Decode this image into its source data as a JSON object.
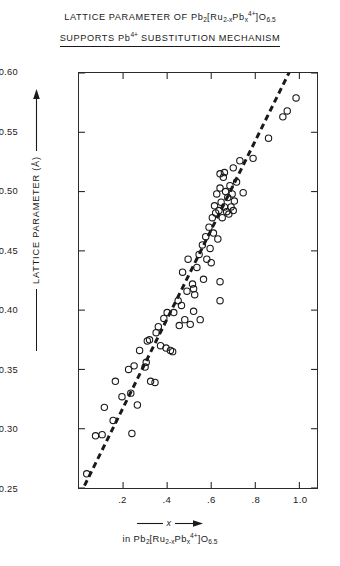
{
  "title": {
    "line1_parts": [
      "LATTICE PARAMETER OF Pb",
      "2",
      "[Ru",
      "2-x",
      "Pb",
      "x",
      "4+",
      "]O",
      "6.5"
    ],
    "line1_plain": "LATTICE PARAMETER OF Pb2[Ru2-xPbx4+]O6.5",
    "line2_plain": "SUPPORTS Pb4+ SUBSTITUTION MECHANISM",
    "line2_a": "SUPPORTS Pb",
    "line2_sup": "4+",
    "line2_b": " SUBSTITUTION MECHANISM"
  },
  "axes": {
    "y_title": "LATTICE PARAMETER (A)",
    "y_unit_symbol": "°",
    "x_title_symbol": "x",
    "x_subtitle_plain": "in Pb2[Ru2-xPbx4+]O6.5",
    "x_sub_in": "in Pb",
    "x_sub_2": "2",
    "x_sub_bracket1": "[Ru",
    "x_sub_2mx": "2-x",
    "x_sub_pb": "Pb",
    "x_sub_x": "x",
    "x_sub_4p": "4+",
    "x_sub_bracket2": "]O",
    "x_sub_65": "6.5",
    "ytick_labels": [
      "10.60",
      "10.55",
      "10.50",
      "10.45",
      "10.40",
      "10.35",
      "10.30",
      "10.25"
    ],
    "xtick_labels": [
      ".2",
      ".4",
      ".6",
      ".8",
      "1.0"
    ]
  },
  "chart_data": {
    "type": "scatter",
    "title": "LATTICE PARAMETER OF Pb2[Ru2-xPbx4+]O6.5 SUPPORTS Pb4+ SUBSTITUTION MECHANISM",
    "xlabel": "x in Pb2[Ru2-xPbx4+]O6.5",
    "ylabel": "LATTICE PARAMETER (A)",
    "xlim": [
      0.0,
      1.08
    ],
    "ylim": [
      10.25,
      10.6
    ],
    "xticks": [
      0.2,
      0.4,
      0.6,
      0.8,
      1.0
    ],
    "yticks": [
      10.25,
      10.3,
      10.35,
      10.4,
      10.45,
      10.5,
      10.55,
      10.6
    ],
    "grid": false,
    "legend": false,
    "marker": "open-circle",
    "marker_color": "#1a1a1a",
    "marker_radius_px": 3.2,
    "points": [
      [
        0.035,
        10.262
      ],
      [
        0.075,
        10.294
      ],
      [
        0.105,
        10.295
      ],
      [
        0.115,
        10.318
      ],
      [
        0.155,
        10.307
      ],
      [
        0.165,
        10.34
      ],
      [
        0.195,
        10.327
      ],
      [
        0.225,
        10.35
      ],
      [
        0.235,
        10.33
      ],
      [
        0.24,
        10.296
      ],
      [
        0.25,
        10.353
      ],
      [
        0.265,
        10.32
      ],
      [
        0.275,
        10.366
      ],
      [
        0.3,
        10.352
      ],
      [
        0.305,
        10.356
      ],
      [
        0.31,
        10.374
      ],
      [
        0.32,
        10.375
      ],
      [
        0.325,
        10.34
      ],
      [
        0.345,
        10.339
      ],
      [
        0.35,
        10.381
      ],
      [
        0.36,
        10.386
      ],
      [
        0.37,
        10.37
      ],
      [
        0.385,
        10.393
      ],
      [
        0.395,
        10.368
      ],
      [
        0.4,
        10.398
      ],
      [
        0.415,
        10.366
      ],
      [
        0.425,
        10.365
      ],
      [
        0.43,
        10.398
      ],
      [
        0.45,
        10.408
      ],
      [
        0.455,
        10.387
      ],
      [
        0.465,
        10.404
      ],
      [
        0.47,
        10.432
      ],
      [
        0.48,
        10.392
      ],
      [
        0.49,
        10.416
      ],
      [
        0.495,
        10.443
      ],
      [
        0.505,
        10.388
      ],
      [
        0.515,
        10.422
      ],
      [
        0.52,
        10.399
      ],
      [
        0.525,
        10.413
      ],
      [
        0.535,
        10.436
      ],
      [
        0.545,
        10.447
      ],
      [
        0.55,
        10.392
      ],
      [
        0.56,
        10.455
      ],
      [
        0.565,
        10.426
      ],
      [
        0.575,
        10.462
      ],
      [
        0.58,
        10.443
      ],
      [
        0.59,
        10.47
      ],
      [
        0.595,
        10.452
      ],
      [
        0.6,
        10.44
      ],
      [
        0.605,
        10.478
      ],
      [
        0.61,
        10.465
      ],
      [
        0.615,
        10.488
      ],
      [
        0.62,
        10.482
      ],
      [
        0.625,
        10.498
      ],
      [
        0.63,
        10.46
      ],
      [
        0.635,
        10.484
      ],
      [
        0.64,
        10.503
      ],
      [
        0.645,
        10.491
      ],
      [
        0.65,
        10.478
      ],
      [
        0.655,
        10.512
      ],
      [
        0.66,
        10.487
      ],
      [
        0.665,
        10.5
      ],
      [
        0.67,
        10.483
      ],
      [
        0.675,
        10.495
      ],
      [
        0.68,
        10.481
      ],
      [
        0.685,
        10.505
      ],
      [
        0.69,
        10.487
      ],
      [
        0.695,
        10.498
      ],
      [
        0.7,
        10.484
      ],
      [
        0.705,
        10.492
      ],
      [
        0.64,
        10.515
      ],
      [
        0.66,
        10.516
      ],
      [
        0.7,
        10.52
      ],
      [
        0.715,
        10.508
      ],
      [
        0.73,
        10.526
      ],
      [
        0.745,
        10.499
      ],
      [
        0.64,
        10.424
      ],
      [
        0.64,
        10.408
      ],
      [
        0.52,
        10.418
      ],
      [
        0.79,
        10.528
      ],
      [
        0.86,
        10.545
      ],
      [
        0.925,
        10.563
      ],
      [
        0.945,
        10.568
      ],
      [
        0.985,
        10.579
      ]
    ],
    "trend_line": {
      "style": "dashed",
      "color": "#1a1a1a",
      "x_start": 0.025,
      "y_start": 10.252,
      "x_end": 0.955,
      "y_end": 10.601
    }
  }
}
